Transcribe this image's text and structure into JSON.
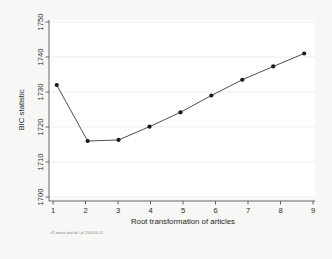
{
  "chart_data": {
    "type": "line",
    "title": "",
    "xlabel": "Root transformation of articles",
    "ylabel": "BIC statistic",
    "x": [
      1,
      2,
      3,
      4,
      5,
      6,
      7,
      8,
      9
    ],
    "values": [
      1732.0,
      1716.0,
      1716.3,
      1720.1,
      1724.2,
      1729.0,
      1733.5,
      1737.3,
      1741.0
    ],
    "xlim": [
      0.75,
      9.35
    ],
    "ylim": [
      1700,
      1750
    ],
    "xticks": [
      "1",
      "2",
      "3",
      "4",
      "5",
      "6",
      "7",
      "8",
      "9"
    ],
    "yticks": [
      "1700",
      "1710",
      "1720",
      "1730",
      "1740",
      "1750"
    ],
    "grid": true,
    "legend": "none",
    "marker": "filled-circle",
    "line_color": "#3a3a3a",
    "marker_color": "#1a1a1a",
    "grid_color": "#e4e4ea",
    "plot_background": "#ffffff",
    "figure_background": "#f7f7f5"
  },
  "footer": {
    "note": "sf7-matrix-plot.do \\ jsl 2008-04-11"
  }
}
